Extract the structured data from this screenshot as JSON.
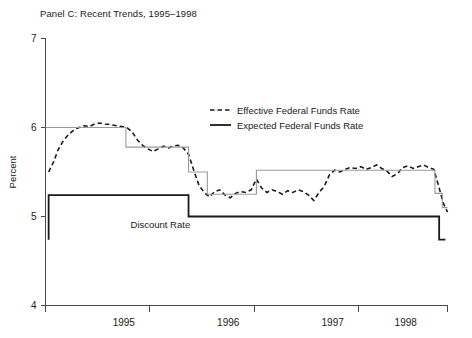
{
  "chart_data": {
    "type": "line",
    "title": "Panel C: Recent Trends, 1995–1998",
    "xlabel": "",
    "ylabel": "Percent",
    "ylim": [
      4,
      7
    ],
    "xlim": [
      1994.75,
      1998.6
    ],
    "ytick_labels": [
      "4",
      "5",
      "6",
      "7"
    ],
    "ytick_values": [
      4,
      5,
      6,
      7
    ],
    "xtick_labels": [
      "1995",
      "1996",
      "1997",
      "1998"
    ],
    "xtick_label_values": [
      1995.5,
      1996.5,
      1997.5,
      1998.2
    ],
    "xtick_values": [
      1994.75,
      1995.75,
      1996.75,
      1997.75,
      1998.6
    ],
    "grid": false,
    "legend_position": "upper-center",
    "annotations": [
      {
        "text": "Discount Rate",
        "x": 1995.85,
        "y": 4.87
      }
    ],
    "series": [
      {
        "name": "Effective Federal Funds Rate",
        "style": "dashed",
        "color": "#1a1a1a",
        "points": [
          [
            1994.78,
            5.5
          ],
          [
            1994.83,
            5.62
          ],
          [
            1994.87,
            5.75
          ],
          [
            1994.92,
            5.85
          ],
          [
            1994.97,
            5.92
          ],
          [
            1995.02,
            5.97
          ],
          [
            1995.07,
            6.0
          ],
          [
            1995.12,
            6.02
          ],
          [
            1995.17,
            6.01
          ],
          [
            1995.22,
            6.04
          ],
          [
            1995.27,
            6.05
          ],
          [
            1995.32,
            6.04
          ],
          [
            1995.38,
            6.03
          ],
          [
            1995.43,
            6.02
          ],
          [
            1995.48,
            6.01
          ],
          [
            1995.53,
            6.0
          ],
          [
            1995.58,
            5.95
          ],
          [
            1995.63,
            5.86
          ],
          [
            1995.68,
            5.8
          ],
          [
            1995.73,
            5.76
          ],
          [
            1995.78,
            5.73
          ],
          [
            1995.83,
            5.76
          ],
          [
            1995.88,
            5.79
          ],
          [
            1995.93,
            5.77
          ],
          [
            1995.97,
            5.79
          ],
          [
            1996.02,
            5.8
          ],
          [
            1996.07,
            5.77
          ],
          [
            1996.12,
            5.7
          ],
          [
            1996.17,
            5.52
          ],
          [
            1996.22,
            5.35
          ],
          [
            1996.27,
            5.27
          ],
          [
            1996.32,
            5.22
          ],
          [
            1996.37,
            5.28
          ],
          [
            1996.42,
            5.3
          ],
          [
            1996.47,
            5.24
          ],
          [
            1996.52,
            5.21
          ],
          [
            1996.57,
            5.26
          ],
          [
            1996.62,
            5.28
          ],
          [
            1996.67,
            5.27
          ],
          [
            1996.72,
            5.3
          ],
          [
            1996.77,
            5.42
          ],
          [
            1996.82,
            5.32
          ],
          [
            1996.87,
            5.27
          ],
          [
            1996.92,
            5.3
          ],
          [
            1996.97,
            5.28
          ],
          [
            1997.02,
            5.25
          ],
          [
            1997.07,
            5.29
          ],
          [
            1997.12,
            5.27
          ],
          [
            1997.17,
            5.3
          ],
          [
            1997.22,
            5.28
          ],
          [
            1997.27,
            5.24
          ],
          [
            1997.32,
            5.18
          ],
          [
            1997.37,
            5.27
          ],
          [
            1997.42,
            5.34
          ],
          [
            1997.47,
            5.47
          ],
          [
            1997.52,
            5.52
          ],
          [
            1997.57,
            5.5
          ],
          [
            1997.62,
            5.53
          ],
          [
            1997.67,
            5.55
          ],
          [
            1997.72,
            5.54
          ],
          [
            1997.77,
            5.56
          ],
          [
            1997.82,
            5.53
          ],
          [
            1997.87,
            5.55
          ],
          [
            1997.92,
            5.58
          ],
          [
            1997.97,
            5.54
          ],
          [
            1998.02,
            5.51
          ],
          [
            1998.07,
            5.45
          ],
          [
            1998.12,
            5.48
          ],
          [
            1998.17,
            5.55
          ],
          [
            1998.22,
            5.57
          ],
          [
            1998.27,
            5.54
          ],
          [
            1998.32,
            5.56
          ],
          [
            1998.37,
            5.58
          ],
          [
            1998.42,
            5.55
          ],
          [
            1998.47,
            5.53
          ],
          [
            1998.52,
            5.32
          ],
          [
            1998.56,
            5.15
          ],
          [
            1998.6,
            5.05
          ]
        ]
      },
      {
        "name": "Expected Federal Funds Rate",
        "style": "step-solid",
        "color": "#9a9a9a",
        "steps": [
          [
            1994.75,
            6.0
          ],
          [
            1995.52,
            6.0
          ],
          [
            1995.52,
            5.78
          ],
          [
            1996.12,
            5.78
          ],
          [
            1996.12,
            5.5
          ],
          [
            1996.3,
            5.5
          ],
          [
            1996.3,
            5.25
          ],
          [
            1996.77,
            5.25
          ],
          [
            1996.77,
            5.52
          ],
          [
            1998.48,
            5.52
          ],
          [
            1998.48,
            5.26
          ],
          [
            1998.55,
            5.26
          ],
          [
            1998.55,
            5.1
          ],
          [
            1998.6,
            5.1
          ]
        ]
      },
      {
        "name": "Discount Rate",
        "style": "step-solid-bold",
        "color": "#1a1a1a",
        "steps": [
          [
            1994.78,
            4.74
          ],
          [
            1994.78,
            5.24
          ],
          [
            1994.82,
            5.24
          ],
          [
            1996.12,
            5.24
          ],
          [
            1996.12,
            5.0
          ],
          [
            1998.52,
            5.0
          ],
          [
            1998.52,
            4.74
          ],
          [
            1998.58,
            4.74
          ]
        ]
      }
    ],
    "legend_entries": [
      {
        "label": "Effective Federal Funds Rate",
        "style": "dashed"
      },
      {
        "label": "Expected Federal Funds Rate",
        "style": "solid"
      }
    ]
  }
}
